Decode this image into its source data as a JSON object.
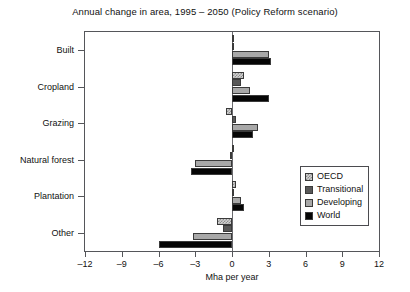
{
  "chart_data": {
    "type": "bar",
    "orientation": "horizontal",
    "title": "Annual change in area, 1995 – 2050 (Policy Reform scenario)",
    "xlabel": "Mha per year",
    "ylabel": "",
    "xlim": [
      -12,
      12
    ],
    "xticks": [
      -12,
      -9,
      -6,
      -3,
      0,
      3,
      6,
      9,
      12
    ],
    "xticklabels": [
      "–12",
      "–9",
      "–6",
      "–3",
      "0",
      "3",
      "6",
      "9",
      "12"
    ],
    "grid": false,
    "legend_position": "lower right inside",
    "categories": [
      "Built",
      "Cropland",
      "Grazing",
      "Natural forest",
      "Plantation",
      "Other"
    ],
    "series": [
      {
        "name": "OECD",
        "color": "#d2d2d2",
        "pattern": "checker",
        "values": [
          0.1,
          1.0,
          -0.5,
          0.05,
          0.35,
          -1.2
        ]
      },
      {
        "name": "Transitional",
        "color": "#585858",
        "pattern": "solid",
        "values": [
          0.05,
          0.7,
          0.35,
          -0.15,
          0.05,
          -0.7
        ]
      },
      {
        "name": "Developing",
        "color": "#a8a8a8",
        "pattern": "solid",
        "values": [
          3.0,
          1.5,
          2.1,
          -3.0,
          0.75,
          -3.2
        ]
      },
      {
        "name": "World",
        "color": "#050505",
        "pattern": "solid",
        "values": [
          3.2,
          3.0,
          1.7,
          -3.35,
          1.0,
          -6.0
        ]
      }
    ]
  },
  "legend": {
    "items": [
      {
        "label": "OECD"
      },
      {
        "label": "Transitional"
      },
      {
        "label": "Developing"
      },
      {
        "label": "World"
      }
    ]
  }
}
